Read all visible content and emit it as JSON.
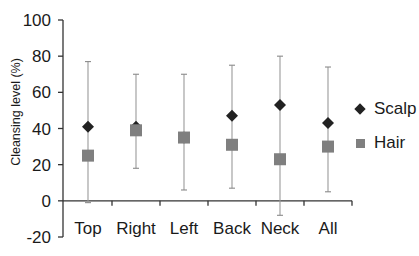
{
  "chart_data": {
    "type": "scatter",
    "title": "",
    "xlabel": "",
    "ylabel": "Cleansing level (%)",
    "ylim": [
      -20,
      100
    ],
    "yticks": [
      -20,
      0,
      20,
      40,
      60,
      80,
      100
    ],
    "grid": false,
    "legend_position": "right",
    "categories": [
      "Top",
      "Right",
      "Left",
      "Back",
      "Neck",
      "All"
    ],
    "series": [
      {
        "name": "Scalp",
        "marker": "diamond",
        "color": "#222222",
        "values": [
          41,
          41,
          35,
          47,
          53,
          43
        ],
        "error_upper": [
          77,
          70,
          70,
          75,
          80,
          74
        ]
      },
      {
        "name": "Hair",
        "marker": "square",
        "color": "#7f7f7f",
        "values": [
          25,
          39,
          35,
          31,
          23,
          30
        ],
        "error_lower": [
          -1,
          18,
          6,
          7,
          -8,
          5
        ]
      }
    ]
  },
  "legend": {
    "items": [
      {
        "label": "Scalp"
      },
      {
        "label": "Hair"
      }
    ]
  }
}
